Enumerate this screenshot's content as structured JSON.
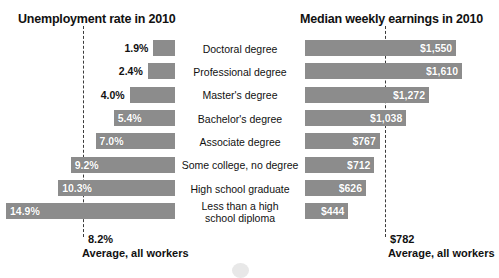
{
  "left_panel": {
    "title": "Unemployment rate in 2010",
    "average_value": "8.2%",
    "average_caption": "Average, all workers"
  },
  "right_panel": {
    "title": "Median weekly earnings in 2010",
    "average_value": "$782",
    "average_caption": "Average, all workers"
  },
  "colors": {
    "bar": "#8c8c8c",
    "text": "#111111",
    "average_line": "#3b3b3b",
    "background": "#ffffff"
  },
  "rows": [
    {
      "category": "Doctoral degree",
      "unemployment_label": "1.9%",
      "unemployment_value": 1.9,
      "earnings_label": "$1,550",
      "earnings_value": 1550
    },
    {
      "category": "Professional degree",
      "unemployment_label": "2.4%",
      "unemployment_value": 2.4,
      "earnings_label": "$1,610",
      "earnings_value": 1610
    },
    {
      "category": "Master's degree",
      "unemployment_label": "4.0%",
      "unemployment_value": 4.0,
      "earnings_label": "$1,272",
      "earnings_value": 1272
    },
    {
      "category": "Bachelor's degree",
      "unemployment_label": "5.4%",
      "unemployment_value": 5.4,
      "earnings_label": "$1,038",
      "earnings_value": 1038
    },
    {
      "category": "Associate degree",
      "unemployment_label": "7.0%",
      "unemployment_value": 7.0,
      "earnings_label": "$767",
      "earnings_value": 767
    },
    {
      "category": "Some college, no degree",
      "unemployment_label": "9.2%",
      "unemployment_value": 9.2,
      "earnings_label": "$712",
      "earnings_value": 712
    },
    {
      "category": "High school graduate",
      "unemployment_label": "10.3%",
      "unemployment_value": 10.3,
      "earnings_label": "$626",
      "earnings_value": 626
    },
    {
      "category": "Less than a high\nschool diploma",
      "unemployment_label": "14.9%",
      "unemployment_value": 14.9,
      "earnings_label": "$444",
      "earnings_value": 444
    }
  ],
  "chart_data": {
    "type": "bar",
    "orientation": "horizontal",
    "layout": "back-to-back / tornado (two mirrored panels sharing centered category labels)",
    "grid": false,
    "legend": null,
    "categories": [
      "Doctoral degree",
      "Professional degree",
      "Master's degree",
      "Bachelor's degree",
      "Associate degree",
      "Some college, no degree",
      "High school graduate",
      "Less than a high school diploma"
    ],
    "series": [
      {
        "name": "Unemployment rate in 2010",
        "unit": "percent",
        "direction": "left (bars extend leftward from shared baseline)",
        "values": [
          1.9,
          2.4,
          4.0,
          5.4,
          7.0,
          9.2,
          10.3,
          14.9
        ],
        "data_labels": [
          "1.9%",
          "2.4%",
          "4.0%",
          "5.4%",
          "7.0%",
          "9.2%",
          "10.3%",
          "14.9%"
        ],
        "xlim": [
          0,
          15.5
        ],
        "reference_line": {
          "label": "Average, all workers",
          "value": 8.2,
          "display": "8.2%"
        }
      },
      {
        "name": "Median weekly earnings in 2010",
        "unit": "US dollars per week",
        "direction": "right (bars extend rightward from shared baseline)",
        "values": [
          1550,
          1610,
          1272,
          1038,
          767,
          712,
          626,
          444
        ],
        "data_labels": [
          "$1,550",
          "$1,610",
          "$1,272",
          "$1,038",
          "$767",
          "$712",
          "$626",
          "$444"
        ],
        "xlim": [
          0,
          1700
        ],
        "reference_line": {
          "label": "Average, all workers",
          "value": 782,
          "display": "$782"
        }
      }
    ],
    "xlabel": "",
    "ylabel": ""
  }
}
